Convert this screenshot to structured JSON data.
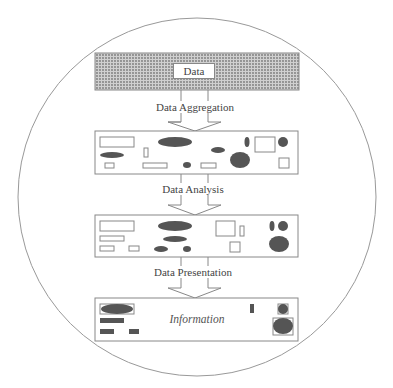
{
  "diagram": {
    "source": {
      "label": "Data"
    },
    "stages": [
      {
        "label": "Data Aggregation"
      },
      {
        "label": "Data Analysis"
      },
      {
        "label": "Data Presentation"
      }
    ],
    "result": {
      "label": "Information"
    },
    "colors": {
      "line": "#888888",
      "fill_dark": "#555555",
      "texture": "#9a9a9a"
    }
  }
}
